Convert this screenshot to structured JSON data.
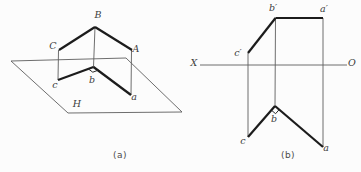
{
  "canvas": {
    "width": 361,
    "height": 172,
    "background": "#fcfcfc"
  },
  "style": {
    "thick_color": "#1c1c1c",
    "thin_color": "#5e5e5e",
    "mark_color": "#2a2a2a",
    "label_color": "#3c3c3c",
    "thick_width": 2.2,
    "thin_width": 0.9,
    "mark_width": 1,
    "label_font_size": 9.5
  },
  "figures": [
    {
      "id": "figure-a",
      "description": "pictorial-view-of-intersecting-lines-above-horizontal-plane",
      "caption": {
        "name": "caption-a",
        "text": "(a)"
      },
      "polygons": [
        {
          "name": "plane-H-outline",
          "points": "11,61 126,58 182,112 68,113",
          "w": "thin"
        }
      ],
      "segments": [
        {
          "name": "projector-B-b",
          "x1": 95,
          "y1": 27,
          "x2": 93.5,
          "y2": 67,
          "w": "thin"
        },
        {
          "name": "projector-C-c",
          "x1": 58.5,
          "y1": 50,
          "x2": 58,
          "y2": 80,
          "w": "thin"
        },
        {
          "name": "projector-A-a",
          "x1": 131.5,
          "y1": 50,
          "x2": 131,
          "y2": 95,
          "w": "thin"
        },
        {
          "name": "edge-C-B",
          "x1": 59,
          "y1": 50,
          "x2": 95,
          "y2": 27,
          "w": "thick"
        },
        {
          "name": "edge-B-A",
          "x1": 95,
          "y1": 27,
          "x2": 132,
          "y2": 50,
          "w": "thick"
        },
        {
          "name": "edge-c-b",
          "x1": 58,
          "y1": 80,
          "x2": 93.5,
          "y2": 67,
          "w": "thick"
        },
        {
          "name": "edge-b-a",
          "x1": 93.5,
          "y1": 67,
          "x2": 131,
          "y2": 95,
          "w": "thick"
        }
      ],
      "marks": [
        {
          "name": "right-angle-mark-at-b",
          "points": "88.3,68.9 92.8,72.2 97.9,70.3"
        }
      ],
      "labels": [
        {
          "name": "label-B",
          "text": "B",
          "x": 98,
          "y": 18
        },
        {
          "name": "label-C",
          "text": "C",
          "x": 53,
          "y": 49
        },
        {
          "name": "label-A",
          "text": "A",
          "x": 136,
          "y": 52
        },
        {
          "name": "label-c",
          "text": "c",
          "x": 55,
          "y": 88
        },
        {
          "name": "label-b",
          "text": "b",
          "x": 92,
          "y": 83
        },
        {
          "name": "label-a",
          "text": "a",
          "x": 134,
          "y": 100
        },
        {
          "name": "label-H",
          "text": "H",
          "x": 77,
          "y": 107
        }
      ]
    },
    {
      "id": "figure-b",
      "description": "orthographic-projection-with-XO-axis",
      "caption": {
        "name": "caption-b",
        "text": "(b)"
      },
      "polygons": [],
      "segments": [
        {
          "name": "axis-X-O",
          "x1": 200,
          "y1": 65,
          "x2": 347,
          "y2": 65,
          "w": "thin"
        },
        {
          "name": "projector-cprime-c",
          "x1": 248,
          "y1": 53,
          "x2": 248,
          "y2": 137,
          "w": "thin"
        },
        {
          "name": "projector-bprime-b",
          "x1": 275.5,
          "y1": 18,
          "x2": 275,
          "y2": 106,
          "w": "thin"
        },
        {
          "name": "projector-aprime-a",
          "x1": 323,
          "y1": 18,
          "x2": 323,
          "y2": 147,
          "w": "thin"
        },
        {
          "name": "edge-cprime-bprime",
          "x1": 248,
          "y1": 53,
          "x2": 275.5,
          "y2": 18,
          "w": "thick"
        },
        {
          "name": "edge-bprime-aprime",
          "x1": 275.5,
          "y1": 18,
          "x2": 323,
          "y2": 18,
          "w": "thick"
        },
        {
          "name": "edge-c-b",
          "x1": 248,
          "y1": 137,
          "x2": 275,
          "y2": 106,
          "w": "thick"
        },
        {
          "name": "edge-b-a",
          "x1": 275,
          "y1": 106,
          "x2": 323,
          "y2": 147,
          "w": "thick"
        }
      ],
      "marks": [
        {
          "name": "right-angle-mark-at-b",
          "points": "271.4,110.2 275.6,113.7 279.2,109.6"
        }
      ],
      "labels": [
        {
          "name": "label-b-prime",
          "text": "b′",
          "x": 273,
          "y": 11
        },
        {
          "name": "label-a-prime",
          "text": "a′",
          "x": 324,
          "y": 12
        },
        {
          "name": "label-c-prime",
          "text": "c′",
          "x": 238,
          "y": 56
        },
        {
          "name": "label-X",
          "text": "X",
          "x": 194,
          "y": 66
        },
        {
          "name": "label-O",
          "text": "O",
          "x": 352,
          "y": 66
        },
        {
          "name": "label-c",
          "text": "c",
          "x": 243,
          "y": 144
        },
        {
          "name": "label-b",
          "text": "b",
          "x": 274,
          "y": 122
        },
        {
          "name": "label-a",
          "text": "a",
          "x": 326,
          "y": 151
        }
      ]
    }
  ]
}
